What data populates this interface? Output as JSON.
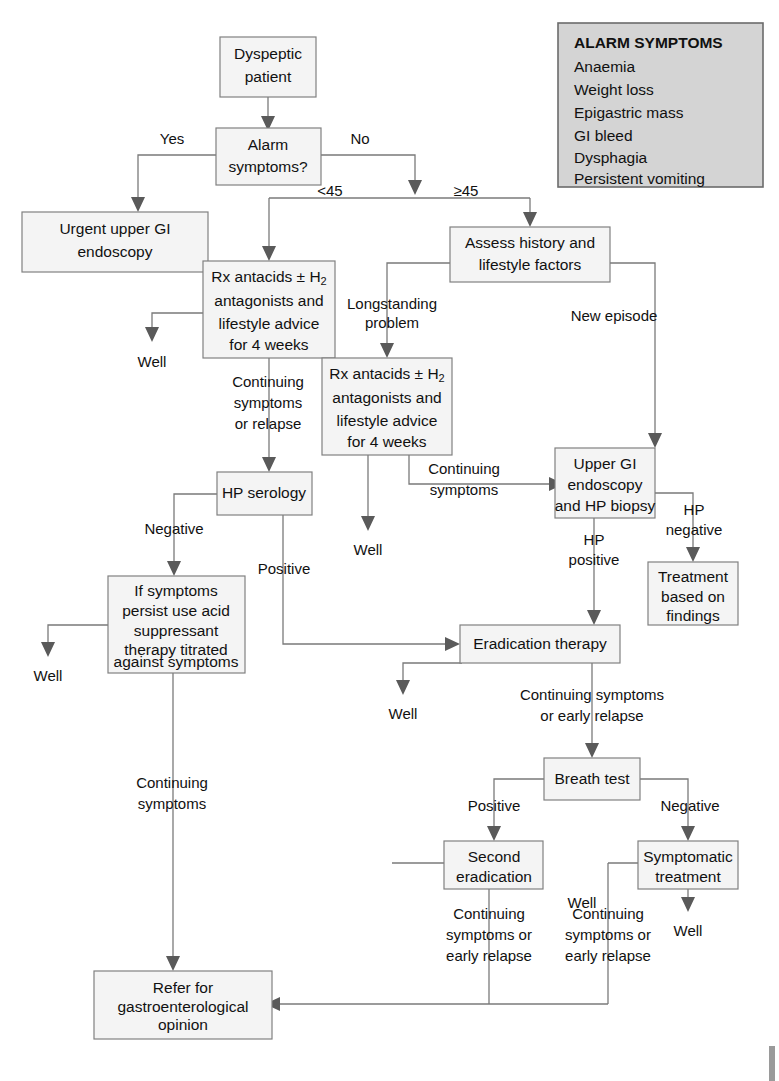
{
  "diagram": {
    "type": "flowchart",
    "colors": {
      "node_fill": "#f4f4f4",
      "node_stroke": "#808080",
      "legend_fill": "#d4d4d4",
      "edge": "#7a7a7a",
      "text": "#111111"
    }
  },
  "legend": {
    "title": "ALARM SYMPTOMS",
    "items": [
      "Anaemia",
      "Weight loss",
      "Epigastric mass",
      "GI bleed",
      "Dysphagia",
      "Persistent vomiting"
    ]
  },
  "nodes": [
    {
      "id": "dyspeptic_patient",
      "lines": [
        "Dyspeptic",
        "patient"
      ]
    },
    {
      "id": "alarm_symptoms",
      "lines": [
        "Alarm",
        "symptoms?"
      ]
    },
    {
      "id": "urgent_endoscopy",
      "lines": [
        "Urgent upper GI",
        "endoscopy"
      ]
    },
    {
      "id": "rx_antacids_young",
      "lines": [
        "Rx antacids ± H2",
        "antagonists and",
        "lifestyle advice",
        "for 4 weeks"
      ]
    },
    {
      "id": "assess_history",
      "lines": [
        "Assess history and",
        "lifestyle factors"
      ]
    },
    {
      "id": "rx_antacids_long",
      "lines": [
        "Rx antacids ± H2",
        "antagonists and",
        "lifestyle advice",
        "for 4 weeks"
      ]
    },
    {
      "id": "hp_serology",
      "lines": [
        "HP serology"
      ]
    },
    {
      "id": "upper_gi_endoscopy_hp",
      "lines": [
        "Upper GI",
        "endoscopy",
        "and HP biopsy"
      ]
    },
    {
      "id": "acid_suppressant",
      "lines": [
        "If symptoms",
        "persist use acid",
        "suppressant",
        "therapy titrated",
        "against symptoms"
      ]
    },
    {
      "id": "treatment_findings",
      "lines": [
        "Treatment",
        "based on",
        "findings"
      ]
    },
    {
      "id": "eradication_therapy",
      "lines": [
        "Eradication therapy"
      ]
    },
    {
      "id": "breath_test",
      "lines": [
        "Breath test"
      ]
    },
    {
      "id": "second_eradication",
      "lines": [
        "Second",
        "eradication"
      ]
    },
    {
      "id": "symptomatic_treatment",
      "lines": [
        "Symptomatic",
        "treatment"
      ]
    },
    {
      "id": "refer_gastro",
      "lines": [
        "Refer for",
        "gastroenterological",
        "opinion"
      ]
    }
  ],
  "terminals": [
    {
      "id": "well_1",
      "label": "Well"
    },
    {
      "id": "well_2",
      "label": "Well"
    },
    {
      "id": "well_3",
      "label": "Well"
    },
    {
      "id": "well_4",
      "label": "Well"
    },
    {
      "id": "well_5",
      "label": "Well"
    },
    {
      "id": "well_6",
      "label": "Well"
    }
  ],
  "edge_labels": [
    {
      "id": "yes",
      "text": "Yes"
    },
    {
      "id": "no",
      "text": "No"
    },
    {
      "id": "under45",
      "text": "<45"
    },
    {
      "id": "over45",
      "text": "≥45"
    },
    {
      "id": "longstanding",
      "lines": [
        "Longstanding",
        "problem"
      ]
    },
    {
      "id": "new_episode",
      "text": "New episode"
    },
    {
      "id": "continuing_relapse1",
      "lines": [
        "Continuing",
        "symptoms",
        "or relapse"
      ]
    },
    {
      "id": "continuing_symptoms1",
      "lines": [
        "Continuing",
        "symptoms"
      ]
    },
    {
      "id": "negative_serology",
      "text": "Negative"
    },
    {
      "id": "positive_serology",
      "text": "Positive"
    },
    {
      "id": "hp_negative",
      "lines": [
        "HP",
        "negative"
      ]
    },
    {
      "id": "hp_positive",
      "lines": [
        "HP",
        "positive"
      ]
    },
    {
      "id": "continuing_early1",
      "lines": [
        "Continuing symptoms",
        "or early relapse"
      ]
    },
    {
      "id": "continuing_symptoms2",
      "lines": [
        "Continuing",
        "symptoms"
      ]
    },
    {
      "id": "positive_breath",
      "text": "Positive"
    },
    {
      "id": "negative_breath",
      "text": "Negative"
    },
    {
      "id": "continuing_early2",
      "lines": [
        "Continuing",
        "symptoms or",
        "early relapse"
      ]
    },
    {
      "id": "continuing_early3",
      "lines": [
        "Continuing",
        "symptoms or",
        "early relapse"
      ]
    }
  ]
}
